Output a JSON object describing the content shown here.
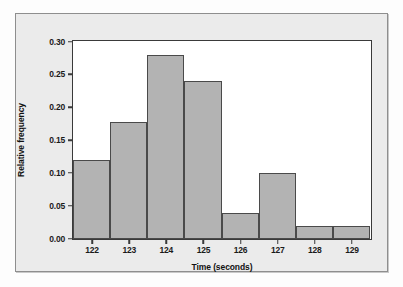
{
  "chart_data": {
    "type": "bar",
    "title": "",
    "subtitle": "",
    "xlabel": "Time (seconds)",
    "ylabel": "Relative frequency",
    "categories": [
      "122",
      "123",
      "124",
      "125",
      "126",
      "127",
      "128",
      "129"
    ],
    "values": [
      0.12,
      0.178,
      0.28,
      0.24,
      0.04,
      0.1,
      0.02,
      0.02
    ],
    "ylim": [
      0.0,
      0.3
    ],
    "xlim": [
      121.5,
      129.5
    ],
    "ytick_labels": [
      "0.00",
      "0.05",
      "0.10",
      "0.15",
      "0.20",
      "0.25",
      "0.30"
    ],
    "ytick_values": [
      0.0,
      0.05,
      0.1,
      0.15,
      0.2,
      0.25,
      0.3
    ],
    "xtick_labels": [
      "122",
      "123",
      "124",
      "125",
      "126",
      "127",
      "128",
      "129"
    ],
    "xtick_values": [
      122,
      123,
      124,
      125,
      126,
      127,
      128,
      129
    ],
    "grid": false,
    "legend": null,
    "legend_position": "none",
    "bar_fill_color": "#b3b3b3",
    "bar_edge_color": "#4a4a4a",
    "plot_background": "#ffffff",
    "figure_background": "#ebebeb",
    "axis_color": "#3a3a3a"
  }
}
